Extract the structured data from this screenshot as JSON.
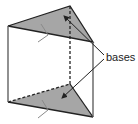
{
  "diagram": {
    "label": "bases",
    "colors": {
      "base_fill": "#a6a6a6",
      "edge": "#222222",
      "tick": "#8a8a8a"
    }
  }
}
